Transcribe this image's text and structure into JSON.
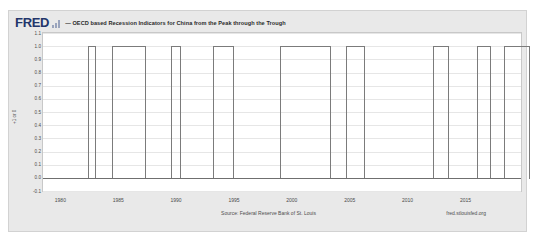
{
  "header": {
    "logo_text": "FRED",
    "logo_icon": "bar-chart-icon",
    "legend_marker_color": "#4572a7",
    "series_title": "— OECD based Recession Indicators for China from the Peak through the Trough"
  },
  "footer": {
    "source": "Source: Federal Reserve Bank of St. Louis",
    "url": "fred.stlouisfed.org"
  },
  "chart_data": {
    "type": "area",
    "title": "OECD based Recession Indicators for China from the Peak through the Trough",
    "xlabel": "",
    "ylabel": "+1 or 0",
    "ylim": [
      -0.1,
      1.1
    ],
    "xlim": [
      1978.5,
      2019.8
    ],
    "grid": true,
    "legend_position": "top",
    "y_ticks": [
      "1.1",
      "1.0",
      "0.9",
      "0.8",
      "0.7",
      "0.6",
      "0.5",
      "0.4",
      "0.3",
      "0.2",
      "0.1",
      "0.0",
      "-0.1"
    ],
    "y_tick_values": [
      1.1,
      1.0,
      0.9,
      0.8,
      0.7,
      0.6,
      0.5,
      0.4,
      0.3,
      0.2,
      0.1,
      0.0,
      -0.1
    ],
    "x_ticks": [
      "1980",
      "1985",
      "1990",
      "1995",
      "2000",
      "2005",
      "2010",
      "2015"
    ],
    "x_tick_values": [
      1980,
      1985,
      1990,
      1995,
      2000,
      2005,
      2010,
      2015
    ],
    "series_name": "OECD based Recession Indicators for China from the Peak through the Trough",
    "series_color": "#4572a7",
    "line_color": "#7b7b7b",
    "value_high": 1.0,
    "value_low": 0.0,
    "recession_periods": [
      {
        "start": 1979.8,
        "end": 1980.5,
        "value": 1
      },
      {
        "start": 1981.9,
        "end": 1984.8,
        "value": 1
      },
      {
        "start": 1986.9,
        "end": 1987.8,
        "value": 1
      },
      {
        "start": 1989.6,
        "end": 1991.3,
        "value": 1
      },
      {
        "start": 1994.8,
        "end": 1998.6,
        "value": 1
      },
      {
        "start": 1999.9,
        "end": 1801.5,
        "value": 1
      },
      {
        "start": 2008.8,
        "end": 2010.1,
        "value": 1
      },
      {
        "start": 2012.6,
        "end": 2013.8,
        "value": 1
      },
      {
        "start": 2014.9,
        "end": 2017.0,
        "value": 1
      },
      {
        "start": 2018.2,
        "end": 2019.1,
        "value": 1
      }
    ],
    "bars_px": [
      {
        "left": 44.6,
        "width": 8.6
      },
      {
        "left": 69.1,
        "width": 34.4
      },
      {
        "left": 128.0,
        "width": 10.4
      },
      {
        "left": 170.2,
        "width": 20.4
      },
      {
        "left": 237.0,
        "width": 51.0
      },
      {
        "left": 303.0,
        "width": 19.2
      },
      {
        "left": 390.0,
        "width": 16.4
      },
      {
        "left": 434.0,
        "width": 14.2
      },
      {
        "left": 461.0,
        "width": 26.4
      },
      {
        "left": 500.0,
        "width": 10.6
      }
    ]
  }
}
